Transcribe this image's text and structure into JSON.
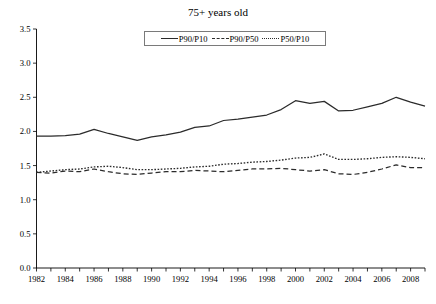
{
  "chart_data": {
    "type": "line",
    "title": "75+ years old",
    "xlabel": "",
    "ylabel": "",
    "ylim": [
      0.0,
      3.5
    ],
    "xlim": [
      1982,
      2009
    ],
    "ytick_labels": [
      "0.0",
      "0.5",
      "1.0",
      "1.5",
      "2.0",
      "2.5",
      "3.0",
      "3.5"
    ],
    "ytick_values": [
      0.0,
      0.5,
      1.0,
      1.5,
      2.0,
      2.5,
      3.0,
      3.5
    ],
    "xtick_labels": [
      "1982",
      "1984",
      "1986",
      "1988",
      "1990",
      "1992",
      "1994",
      "1996",
      "1998",
      "2000",
      "2002",
      "2004",
      "2006",
      "2008"
    ],
    "x": [
      1982,
      1983,
      1984,
      1985,
      1986,
      1987,
      1988,
      1989,
      1990,
      1991,
      1992,
      1993,
      1994,
      1995,
      1996,
      1997,
      1998,
      1999,
      2000,
      2001,
      2002,
      2003,
      2004,
      2005,
      2006,
      2007,
      2008,
      2009
    ],
    "grid": false,
    "legend_position": "top-center",
    "series": [
      {
        "name": "P90/P10",
        "style": "solid",
        "values": [
          1.93,
          1.93,
          1.94,
          1.96,
          2.03,
          1.97,
          1.92,
          1.87,
          1.92,
          1.95,
          1.99,
          2.06,
          2.08,
          2.16,
          2.18,
          2.21,
          2.24,
          2.32,
          2.45,
          2.41,
          2.44,
          2.3,
          2.31,
          2.36,
          2.41,
          2.5,
          2.43,
          2.37
        ]
      },
      {
        "name": "P90/P50",
        "style": "dashed",
        "values": [
          1.4,
          1.39,
          1.42,
          1.41,
          1.45,
          1.41,
          1.38,
          1.37,
          1.39,
          1.41,
          1.41,
          1.43,
          1.42,
          1.41,
          1.43,
          1.45,
          1.45,
          1.46,
          1.44,
          1.42,
          1.44,
          1.38,
          1.37,
          1.4,
          1.45,
          1.51,
          1.47,
          1.47
        ]
      },
      {
        "name": "P50/P10",
        "style": "dotted",
        "values": [
          1.4,
          1.42,
          1.44,
          1.45,
          1.48,
          1.49,
          1.47,
          1.44,
          1.44,
          1.45,
          1.46,
          1.48,
          1.49,
          1.52,
          1.53,
          1.55,
          1.56,
          1.58,
          1.61,
          1.62,
          1.67,
          1.59,
          1.59,
          1.6,
          1.62,
          1.63,
          1.62,
          1.6
        ]
      }
    ]
  },
  "legend": {
    "entries": [
      {
        "label": "P90/P10"
      },
      {
        "label": "P90/P50"
      },
      {
        "label": "P50/P10"
      }
    ]
  }
}
